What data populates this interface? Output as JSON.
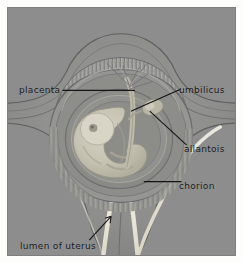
{
  "figure": {
    "domain_kind": "anatomical-illustration",
    "panel_background_color": "#8d8d8d",
    "page_background_color": "#fdfdfb",
    "label_color": "#17171a",
    "leader_line_color": "#141416",
    "lumen_color": "#e6e2d2",
    "tissue_light_color": "#a3a3a0",
    "tissue_mid_color": "#8a8a88",
    "tissue_dark_color": "#6f6f6e",
    "embryo_color": "#c9c6b6"
  },
  "labels": [
    {
      "id": "placenta",
      "text": "placenta",
      "x": 18,
      "y": 82,
      "leader": "horizontal line extending right to the villous band"
    },
    {
      "id": "umbilicus",
      "text": "umbilicus",
      "x": 178,
      "y": 82,
      "leader": "diagonal line extending down-left to the umbilical cord"
    },
    {
      "id": "allantois",
      "text": "allantois",
      "x": 183,
      "y": 141,
      "leader": "diagonal line extending up-left to the allantoic sac"
    },
    {
      "id": "chorion",
      "text": "chorion",
      "x": 178,
      "y": 178,
      "leader": "horizontal line extending left to the chorionic membrane"
    },
    {
      "id": "lumen-of-uterus",
      "text": "lumen of uterus",
      "x": 19,
      "y": 240,
      "leader": "diagonal arrow extending up-right to the cervical canal"
    }
  ]
}
